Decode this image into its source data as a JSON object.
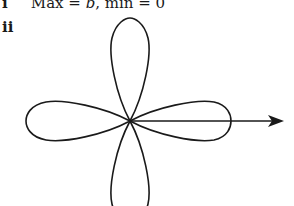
{
  "parts": [
    {
      "label": "i",
      "text_prefix": "Max = ",
      "var": "b",
      "text_suffix": ", min = 0"
    },
    {
      "label": "ii"
    }
  ],
  "diagram": {
    "type": "polar rose curve (four petals)",
    "petals": 4,
    "petal_directions": [
      "up",
      "right",
      "down",
      "left"
    ],
    "axis": "initial line arrow pointing right from pole",
    "stroke_color": "#1a1a1a"
  }
}
